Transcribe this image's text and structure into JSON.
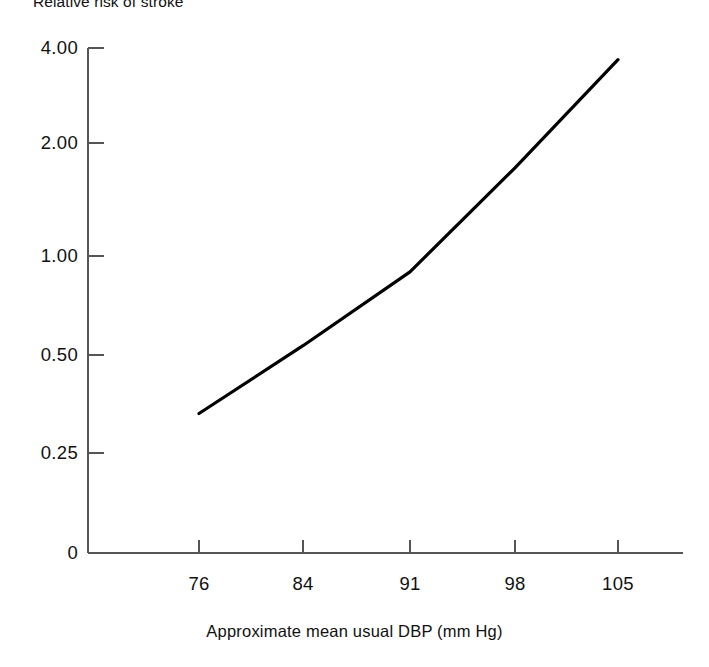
{
  "chart_data": {
    "type": "line",
    "title": "Relative risk of stroke",
    "xlabel": "Approximate mean usual DBP (mm Hg)",
    "ylabel": "",
    "x": [
      76,
      84,
      91,
      98,
      105
    ],
    "values": [
      0.35,
      0.55,
      0.9,
      1.8,
      3.7
    ],
    "categories": [
      "76",
      "84",
      "91",
      "98",
      "105"
    ],
    "series": [
      {
        "name": "Relative risk of stroke",
        "values": [
          0.35,
          0.55,
          0.9,
          1.8,
          3.7
        ]
      }
    ],
    "xtick_labels": [
      "76",
      "84",
      "91",
      "98",
      "105"
    ],
    "ytick_labels": [
      "4.00",
      "2.00",
      "1.00",
      "0.50",
      "0.25",
      "0"
    ],
    "ytick_values": [
      4.0,
      2.0,
      1.0,
      0.5,
      0.25,
      0
    ],
    "yscale": "log",
    "ylim": [
      0.25,
      4.0
    ],
    "xlim": [
      70,
      112
    ],
    "grid": false,
    "legend": false,
    "line_color": "#000000",
    "axis_color": "#555555"
  },
  "axis": {
    "title": "Relative risk of stroke",
    "xlabel": "Approximate mean usual DBP (mm Hg)",
    "yticks": [
      {
        "label": "4.00",
        "y": 48
      },
      {
        "label": "2.00",
        "y": 143
      },
      {
        "label": "1.00",
        "y": 256
      },
      {
        "label": "0.50",
        "y": 355
      },
      {
        "label": "0.25",
        "y": 453
      },
      {
        "label": "0",
        "y": 553
      }
    ],
    "xticks": [
      {
        "label": "76",
        "x": 199
      },
      {
        "label": "84",
        "x": 303
      },
      {
        "label": "91",
        "x": 410
      },
      {
        "label": "98",
        "x": 515
      },
      {
        "label": "105",
        "x": 618
      }
    ]
  }
}
